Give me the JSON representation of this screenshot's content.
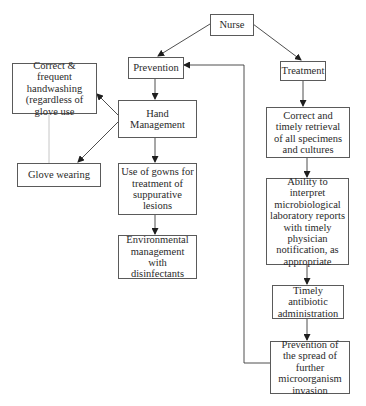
{
  "diagram": {
    "type": "flowchart",
    "root": "Nurse",
    "nodes": {
      "nurse": {
        "label": "Nurse"
      },
      "prevention": {
        "label": "Prevention"
      },
      "treatment": {
        "label": "Treatment"
      },
      "hand_management": {
        "label": "Hand Management"
      },
      "handwashing": {
        "label": "Correct & frequent handwashing (regardless of glove use"
      },
      "glove_wearing": {
        "label": "Glove wearing"
      },
      "gowns": {
        "label": "Use of gowns for treatment of suppurative lesions"
      },
      "environmental": {
        "label": "Environmental management with disinfectants"
      },
      "retrieval": {
        "label": "Correct and timely retrieval of all specimens and cultures"
      },
      "interpret": {
        "label": "Ability to interpret microbiological laboratory reports with timely physician notification, as appropriate"
      },
      "antibiotic": {
        "label": "Timely antibiotic administration"
      },
      "spread": {
        "label": "Prevention of the spread of further microorganism invasion"
      }
    },
    "edges": [
      {
        "from": "Nurse",
        "to": "Prevention",
        "style": "arrow"
      },
      {
        "from": "Nurse",
        "to": "Treatment",
        "style": "arrow"
      },
      {
        "from": "Prevention",
        "to": "Hand Management",
        "style": "arrow"
      },
      {
        "from": "Hand Management",
        "to": "Correct & frequent handwashing (regardless of glove use",
        "style": "arrow"
      },
      {
        "from": "Hand Management",
        "to": "Glove wearing",
        "style": "arrow"
      },
      {
        "from": "Correct & frequent handwashing (regardless of glove use",
        "to": "Glove wearing",
        "style": "line"
      },
      {
        "from": "Hand Management",
        "to": "Use of gowns for treatment of suppurative lesions",
        "style": "arrow"
      },
      {
        "from": "Use of gowns for treatment of suppurative lesions",
        "to": "Environmental management with disinfectants",
        "style": "arrow"
      },
      {
        "from": "Treatment",
        "to": "Correct and timely retrieval of all specimens and cultures",
        "style": "arrow"
      },
      {
        "from": "Correct and timely retrieval of all specimens and cultures",
        "to": "Ability to interpret microbiological laboratory reports with timely physician notification, as appropriate",
        "style": "arrow"
      },
      {
        "from": "Ability to interpret microbiological laboratory reports with timely physician notification, as appropriate",
        "to": "Timely antibiotic administration",
        "style": "arrow"
      },
      {
        "from": "Timely antibiotic administration",
        "to": "Prevention of the spread of further microorganism invasion",
        "style": "arrow"
      },
      {
        "from": "Prevention of the spread of further microorganism invasion",
        "to": "Prevention",
        "style": "arrow-feedback"
      }
    ]
  },
  "colors": {
    "line": "#3a3a3a",
    "border": "#5a5a5a",
    "text": "#2a2a2a",
    "background": "#ffffff"
  }
}
